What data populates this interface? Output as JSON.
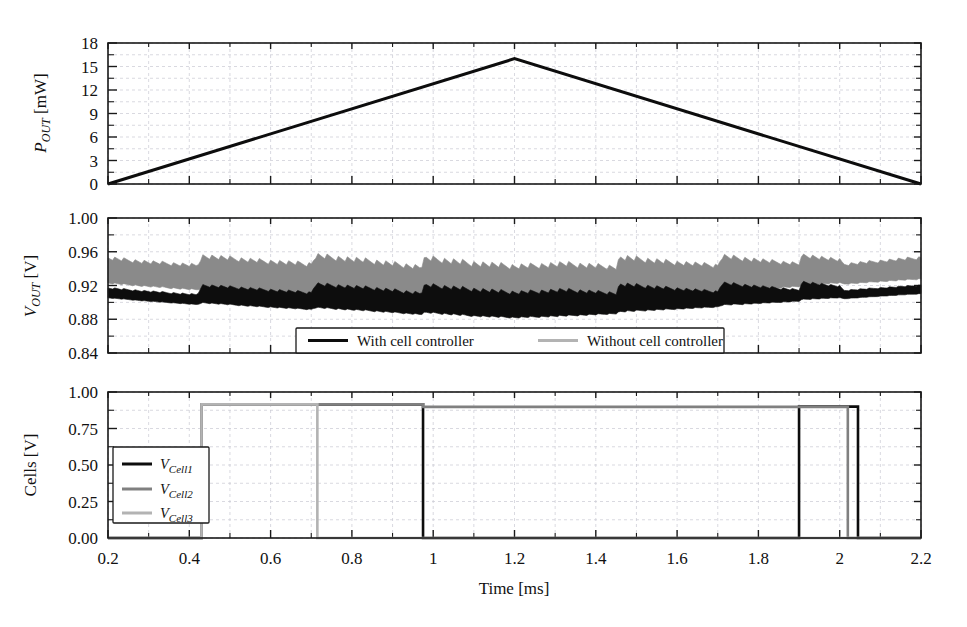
{
  "figure": {
    "background_color": "#ffffff",
    "ink_color": "#111111",
    "grid_color": "#c9c9d2",
    "xlabel": "Time [ms]",
    "x_ticks": [
      "0.2",
      "0.4",
      "0.6",
      "0.8",
      "1",
      "1.2",
      "1.4",
      "1.6",
      "1.8",
      "2",
      "2.2"
    ],
    "x_tick_values": [
      0.2,
      0.4,
      0.6,
      0.8,
      1.0,
      1.2,
      1.4,
      1.6,
      1.8,
      2.0,
      2.2
    ],
    "xlim": [
      0.2,
      2.2
    ]
  },
  "colors": {
    "black": "#0d0d0d",
    "gray": "#808080",
    "light_gray": "#b3b3b3",
    "band_gray": "#8a8a8a"
  },
  "chart_data": [
    {
      "type": "line",
      "panel": "top",
      "panel_name": "output-power",
      "title": "",
      "xlabel": "Time [ms]",
      "ylabel": "P_OUT [mW]",
      "ylabel_parts": {
        "symbol": "P",
        "subscript": "OUT",
        "unit": "[mW]"
      },
      "xlim": [
        0.2,
        2.2
      ],
      "ylim": [
        0,
        18
      ],
      "y_ticks": [
        "0",
        "3",
        "6",
        "9",
        "12",
        "15",
        "18"
      ],
      "y_tick_values": [
        0,
        3,
        6,
        9,
        12,
        15,
        18
      ],
      "grid": true,
      "legend_position": "none",
      "series": [
        {
          "name": "P_OUT",
          "color": "#0d0d0d",
          "linewidth": 3.0,
          "x": [
            0.2,
            1.2,
            2.2
          ],
          "values": [
            0,
            16,
            0
          ],
          "description": "Triangular power ramp peaking at 16 mW at t = 1.2 ms"
        }
      ]
    },
    {
      "type": "area",
      "panel": "middle",
      "panel_name": "output-voltage",
      "title": "",
      "xlabel": "Time [ms]",
      "ylabel": "V_OUT [V]",
      "ylabel_parts": {
        "symbol": "V",
        "subscript": "OUT",
        "unit": "[V]"
      },
      "xlim": [
        0.2,
        2.2
      ],
      "ylim": [
        0.84,
        1.0
      ],
      "y_ticks": [
        "0.84",
        "0.88",
        "0.92",
        "0.96",
        "1.00"
      ],
      "y_tick_values": [
        0.84,
        0.88,
        0.92,
        0.96,
        1.0
      ],
      "grid": true,
      "legend_position": "lower-center",
      "legend": [
        {
          "label": "With cell controller",
          "color": "#0d0d0d"
        },
        {
          "label": "Without cell controller",
          "color": "#b3b3b3"
        }
      ],
      "series": [
        {
          "name": "Without cell controller",
          "color": "#8a8a8a",
          "kind": "ripple-band",
          "description": "Wide switching ripple envelope, sawtooth segments with step discontinuities",
          "x": [
            0.2,
            0.3,
            0.42,
            0.43,
            0.55,
            0.7,
            0.71,
            0.85,
            0.97,
            0.98,
            1.1,
            1.2,
            1.32,
            1.45,
            1.46,
            1.58,
            1.7,
            1.71,
            1.83,
            1.9,
            1.91,
            2.0,
            2.01,
            2.1,
            2.2
          ],
          "upper": [
            0.955,
            0.95,
            0.946,
            0.958,
            0.953,
            0.948,
            0.959,
            0.952,
            0.945,
            0.956,
            0.95,
            0.946,
            0.949,
            0.945,
            0.957,
            0.951,
            0.946,
            0.958,
            0.951,
            0.948,
            0.959,
            0.952,
            0.947,
            0.951,
            0.955
          ],
          "lower": [
            0.922,
            0.918,
            0.914,
            0.916,
            0.912,
            0.908,
            0.91,
            0.906,
            0.902,
            0.904,
            0.9,
            0.898,
            0.9,
            0.903,
            0.905,
            0.908,
            0.911,
            0.913,
            0.916,
            0.918,
            0.92,
            0.922,
            0.921,
            0.924,
            0.927
          ]
        },
        {
          "name": "With cell controller",
          "color": "#0d0d0d",
          "kind": "ripple-band",
          "description": "Narrow switching ripple envelope, lower mean voltage with sawtooth steps",
          "x": [
            0.2,
            0.3,
            0.42,
            0.43,
            0.55,
            0.7,
            0.71,
            0.85,
            0.97,
            0.98,
            1.1,
            1.2,
            1.32,
            1.45,
            1.46,
            1.58,
            1.7,
            1.71,
            1.83,
            1.9,
            1.91,
            2.0,
            2.01,
            2.1,
            2.2
          ],
          "upper": [
            0.918,
            0.914,
            0.91,
            0.922,
            0.918,
            0.913,
            0.924,
            0.919,
            0.913,
            0.923,
            0.918,
            0.914,
            0.917,
            0.913,
            0.924,
            0.919,
            0.914,
            0.925,
            0.919,
            0.916,
            0.926,
            0.92,
            0.915,
            0.918,
            0.921
          ],
          "lower": [
            0.905,
            0.901,
            0.897,
            0.899,
            0.895,
            0.891,
            0.893,
            0.889,
            0.885,
            0.887,
            0.883,
            0.881,
            0.883,
            0.886,
            0.888,
            0.891,
            0.894,
            0.896,
            0.899,
            0.901,
            0.903,
            0.905,
            0.904,
            0.907,
            0.91
          ]
        }
      ]
    },
    {
      "type": "line",
      "panel": "bottom",
      "panel_name": "cell-voltages",
      "title": "",
      "xlabel": "Time [ms]",
      "ylabel": "Cells [V]",
      "ylabel_parts": {
        "symbol": "Cells",
        "subscript": "",
        "unit": "[V]"
      },
      "xlim": [
        0.2,
        2.2
      ],
      "ylim": [
        0.0,
        1.0
      ],
      "y_ticks": [
        "0.00",
        "0.25",
        "0.50",
        "0.75",
        "1.00"
      ],
      "y_tick_values": [
        0.0,
        0.25,
        0.5,
        0.75,
        1.0
      ],
      "grid": true,
      "legend_position": "lower-left",
      "legend": [
        {
          "label": "V_Cell1",
          "label_symbol": "V",
          "label_sub": "Cell1",
          "color": "#0d0d0d"
        },
        {
          "label": "V_Cell2",
          "label_symbol": "V",
          "label_sub": "Cell2",
          "color": "#808080"
        },
        {
          "label": "V_Cell3",
          "label_symbol": "V",
          "label_sub": "Cell3",
          "color": "#b3b3b3"
        }
      ],
      "series": [
        {
          "name": "V_Cell1",
          "color": "#0d0d0d",
          "linewidth": 2.6,
          "x": [
            0.2,
            0.43,
            0.43,
            0.975,
            0.975,
            1.9,
            1.9,
            2.045,
            2.045,
            2.2
          ],
          "values": [
            0.0,
            0.0,
            0.915,
            0.915,
            0.0,
            0.0,
            0.9,
            0.9,
            0.0,
            0.0
          ],
          "description": "Cell 1 enabled 0.43-0.98 ms and pulsed again 1.90-2.045 ms"
        },
        {
          "name": "V_Cell2",
          "color": "#808080",
          "linewidth": 2.6,
          "x": [
            0.2,
            0.43,
            0.43,
            0.975,
            0.975,
            2.02,
            2.02,
            2.2
          ],
          "values": [
            0.0,
            0.0,
            0.915,
            0.915,
            0.898,
            0.898,
            0.0,
            0.0
          ],
          "description": "Cell 2 enabled from 0.43 ms until 2.02 ms"
        },
        {
          "name": "V_Cell3",
          "color": "#b3b3b3",
          "linewidth": 2.6,
          "x": [
            0.2,
            0.43,
            0.43,
            0.715,
            0.715,
            2.03,
            2.03,
            2.2
          ],
          "values": [
            0.0,
            0.0,
            0.915,
            0.915,
            0.0,
            0.0,
            0.0,
            0.0
          ],
          "description": "Cell 3 enabled 0.43-0.715 ms only"
        }
      ]
    }
  ]
}
